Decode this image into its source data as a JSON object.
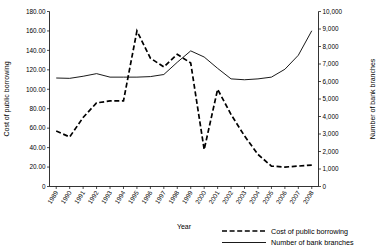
{
  "chart_data": {
    "type": "line",
    "title": "",
    "xlabel": "Year",
    "ylabel": "Cost of public borrowing",
    "y2label": "Number of bank branches",
    "grid": false,
    "legend_position": "bottom-right",
    "x": [
      1989,
      1990,
      1991,
      1992,
      1993,
      1994,
      1995,
      1996,
      1997,
      1998,
      1999,
      2000,
      2001,
      2002,
      2003,
      2004,
      2005,
      2006,
      2007,
      2008
    ],
    "xtick_labels": [
      "1989",
      "1990",
      "1991",
      "1992",
      "1993",
      "1994",
      "1995",
      "1996",
      "1997",
      "1998",
      "1999",
      "2000",
      "2001",
      "2002",
      "2003",
      "2004",
      "2005",
      "2006",
      "2007",
      "2008"
    ],
    "ylim": [
      0,
      180
    ],
    "ytick_labels": [
      "0",
      "20.00",
      "40.00",
      "60.00",
      "80.00",
      "100.00",
      "120.00",
      "140.00",
      "160.00",
      "180.00"
    ],
    "ytick_values": [
      0,
      20,
      40,
      60,
      80,
      100,
      120,
      140,
      160,
      180
    ],
    "y2lim": [
      0,
      10000
    ],
    "y2tick_labels": [
      "0",
      "1,000",
      "2,000",
      "3,000",
      "4,000",
      "5,000",
      "6,000",
      "7,000",
      "8,000",
      "9,000",
      "10,000"
    ],
    "y2tick_values": [
      0,
      1000,
      2000,
      3000,
      4000,
      5000,
      6000,
      7000,
      8000,
      9000,
      10000
    ],
    "series": [
      {
        "name": "Cost of public borrowing",
        "axis": "left",
        "style": "dashed",
        "values": [
          57,
          51,
          71,
          86,
          88,
          88,
          160,
          132,
          123,
          136,
          127,
          38,
          100,
          74,
          52,
          33,
          21,
          20,
          21,
          22
        ]
      },
      {
        "name": "Number of bank branches",
        "axis": "right",
        "style": "solid",
        "values": [
          6200,
          6180,
          6300,
          6450,
          6250,
          6250,
          6250,
          6280,
          6400,
          7100,
          7750,
          7400,
          6750,
          6150,
          6100,
          6150,
          6250,
          6700,
          7500,
          8900
        ]
      }
    ],
    "legend": [
      {
        "label": "Cost of public borrowing",
        "style": "dashed"
      },
      {
        "label": "Number of bank branches",
        "style": "solid"
      }
    ]
  }
}
